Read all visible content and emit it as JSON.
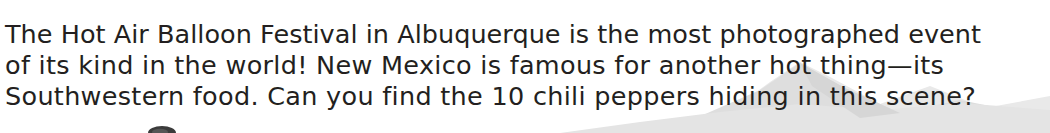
{
  "page": {
    "background_color": "#ffffff",
    "text_color": "#231f20"
  },
  "caption": {
    "full_text": "The Hot Air Balloon Festival in Albuquerque is the most photographed event of its kind in the world! New Mexico is famous for another hot thing—its Southwestern food. Can you find the 10 chili peppers hiding in this scene?",
    "line_1": "The Hot Air Balloon Festival in Albuquerque is the most photographed event",
    "line_2": "of its kind in the world! New Mexico is famous for another hot thing—its",
    "line_3": "Southwestern food. Can you find the 10 chili peppers hiding in this scene?",
    "highlighted_count": "10"
  },
  "scenery": {
    "mountain_color": "#dcdcdc",
    "mountain_highlight_color": "#e8e8e8",
    "mountain_shadow_color": "#d2d2d2",
    "balloon_top_color": "#3b3b3b"
  }
}
